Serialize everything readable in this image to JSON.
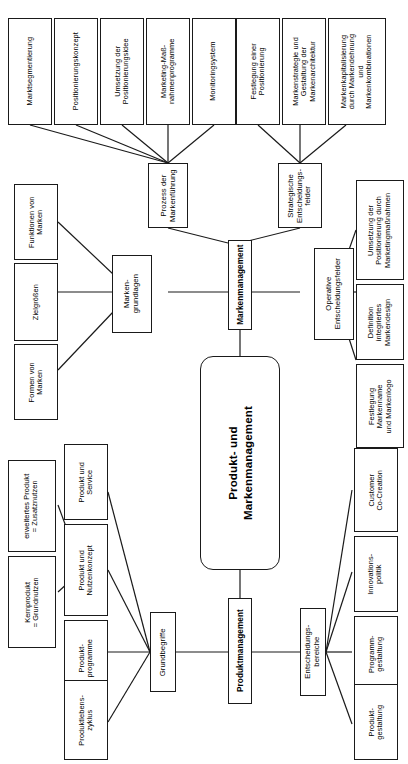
{
  "diagram": {
    "title": "Produkt- und Markenmanagement",
    "orientation": "rotated-90-ccw",
    "root": {
      "id": "root",
      "label": "Produkt- und\nMarkenmanagement"
    },
    "branches": [
      {
        "id": "markenmanagement",
        "label": "Markenmanagement",
        "children": [
          {
            "id": "markengrundlagen",
            "label": "Marken-\ngrundlagen",
            "leaves": [
              {
                "id": "funktionen-von-marken",
                "label": "Funktionen von\nMarken"
              },
              {
                "id": "zielgroessen",
                "label": "Zielgrößen"
              },
              {
                "id": "formen-von-marken",
                "label": "Formen von\nMarken"
              }
            ]
          },
          {
            "id": "prozess-der-markenfuehrung",
            "label": "Prozess der\nMarkenführung",
            "leaves": [
              {
                "id": "marktsegmentierung",
                "label": "Marktsegmentierung"
              },
              {
                "id": "positionierungskonzept",
                "label": "Positionierungskonzept"
              },
              {
                "id": "umsetzung-positionierungsidee",
                "label": "Umsetzung der\nPositionierungsidee"
              },
              {
                "id": "marketing-massnahmenprogramme",
                "label": "Marketing-Maß-\nnahmenprogramme"
              },
              {
                "id": "monitoringsystem",
                "label": "Monitoringsystem"
              }
            ]
          },
          {
            "id": "strategische-entscheidungsfelder",
            "label": "Strategische\nEntscheidungs-\nfelder",
            "leaves": [
              {
                "id": "festlegung-positionierung",
                "label": "Festlegung einer\nPositionierung"
              },
              {
                "id": "markenstrategie-markenarchitektur",
                "label": "Markenstrategie und\nGestaltung der\nMarkenarchitektur"
              },
              {
                "id": "markenkapitalisierung",
                "label": "Markenkapitalisierung\ndurch Markendehnung\nund\nMarkenkombinationen"
              }
            ]
          },
          {
            "id": "operative-entscheidungsfelder",
            "label": "Operative\nEntscheidungsfelder",
            "leaves": [
              {
                "id": "umsetzung-positionierung-marketingmassnahmen",
                "label": "Umsetzung der\nPositionierung durch\nMarketingmaßnahmen"
              },
              {
                "id": "definition-integriertes-markendesign",
                "label": "Definition\nintegriertes\nMarkendesign"
              },
              {
                "id": "festlegung-markenname-markenlogo",
                "label": "Festlegung\nMarkenname\nund Markenlogo"
              }
            ]
          }
        ]
      },
      {
        "id": "produktmanagement",
        "label": "Produktmanagement",
        "children": [
          {
            "id": "grundbegriffe",
            "label": "Grundbegriffe",
            "leaves": [
              {
                "id": "produkt-und-service",
                "label": "Produkt und\nService"
              },
              {
                "id": "produkt-und-nutzenkonzept",
                "label": "Produkt und\nNutzenkonzept"
              },
              {
                "id": "produktprogramme",
                "label": "Produkt-\nprogramme"
              },
              {
                "id": "produktlebenszyklus",
                "label": "Produktlebens-\nzyklus"
              }
            ],
            "subleaves": [
              {
                "id": "erweitertes-produkt",
                "label": "erweitertes Produkt\n= Zusatznutzen"
              },
              {
                "id": "kernprodukt",
                "label": "Kernprodukt\n= Grundnutzen"
              }
            ]
          },
          {
            "id": "entscheidungsbereiche",
            "label": "Entscheidungs-\nbereiche",
            "leaves": [
              {
                "id": "customer-co-creation",
                "label": "Customer\nCo-Creation"
              },
              {
                "id": "innovationspolitik",
                "label": "Innovations-\npolitik"
              },
              {
                "id": "programmgestaltung",
                "label": "Programm-\ngestaltung"
              },
              {
                "id": "produktgestaltung",
                "label": "Produkt-\ngestaltung"
              }
            ]
          }
        ]
      }
    ]
  },
  "style": {
    "line_color": "#1a1a1a",
    "box_fill": "#ffffff",
    "background": "#ffffff"
  }
}
